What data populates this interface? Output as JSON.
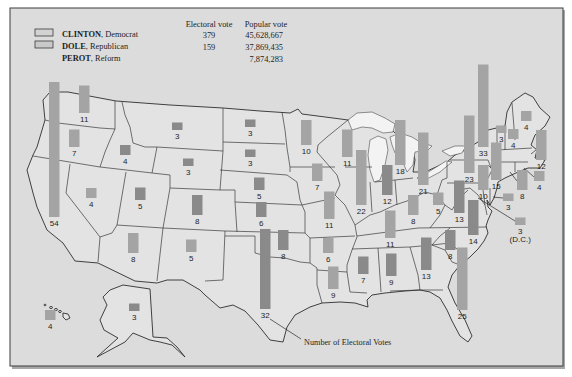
{
  "legend": {
    "headers": {
      "electoral_vote": "Electoral vote",
      "popular_vote": "Popular vote"
    },
    "separator": ", ",
    "candidates": [
      {
        "name": "CLINTON",
        "party": "Democrat",
        "electoral_vote": "379",
        "popular_vote": "45,628,667"
      },
      {
        "name": "DOLE",
        "party": "Republican",
        "electoral_vote": "159",
        "popular_vote": "37,869,435"
      },
      {
        "name": "PEROT",
        "party": "Reform",
        "electoral_vote": "",
        "popular_vote": "7,874,283"
      }
    ]
  },
  "callout": {
    "label": "Number of Electoral Votes"
  },
  "colors": {
    "clinton_bar": "#a4a4a4",
    "dole_bar": "#8a8a8a",
    "clinton_swatch": "#d2d2d2",
    "dole_swatch": "#c9c9c9"
  },
  "map_data": {
    "type": "proportional-bar map",
    "value_meaning": "Number of Electoral Votes",
    "states": [
      {
        "state": "Washington",
        "ev": 11,
        "winner": "Clinton"
      },
      {
        "state": "Oregon",
        "ev": 7,
        "winner": "Clinton"
      },
      {
        "state": "California",
        "ev": 54,
        "winner": "Clinton"
      },
      {
        "state": "Idaho",
        "ev": 4,
        "winner": "Dole"
      },
      {
        "state": "Nevada",
        "ev": 4,
        "winner": "Clinton"
      },
      {
        "state": "Montana",
        "ev": 3,
        "winner": "Dole"
      },
      {
        "state": "Wyoming",
        "ev": 3,
        "winner": "Dole"
      },
      {
        "state": "Utah",
        "ev": 5,
        "winner": "Dole"
      },
      {
        "state": "Colorado",
        "ev": 8,
        "winner": "Dole"
      },
      {
        "state": "Arizona",
        "ev": 8,
        "winner": "Clinton"
      },
      {
        "state": "New Mexico",
        "ev": 5,
        "winner": "Clinton"
      },
      {
        "state": "North Dakota",
        "ev": 3,
        "winner": "Dole"
      },
      {
        "state": "South Dakota",
        "ev": 3,
        "winner": "Dole"
      },
      {
        "state": "Nebraska",
        "ev": 5,
        "winner": "Dole"
      },
      {
        "state": "Kansas",
        "ev": 6,
        "winner": "Dole"
      },
      {
        "state": "Oklahoma",
        "ev": 8,
        "winner": "Dole"
      },
      {
        "state": "Texas",
        "ev": 32,
        "winner": "Dole"
      },
      {
        "state": "Minnesota",
        "ev": 10,
        "winner": "Clinton"
      },
      {
        "state": "Iowa",
        "ev": 7,
        "winner": "Clinton"
      },
      {
        "state": "Missouri",
        "ev": 11,
        "winner": "Clinton"
      },
      {
        "state": "Arkansas",
        "ev": 6,
        "winner": "Clinton"
      },
      {
        "state": "Louisiana",
        "ev": 9,
        "winner": "Clinton"
      },
      {
        "state": "Wisconsin",
        "ev": 11,
        "winner": "Clinton"
      },
      {
        "state": "Illinois",
        "ev": 22,
        "winner": "Clinton"
      },
      {
        "state": "Michigan",
        "ev": 18,
        "winner": "Clinton"
      },
      {
        "state": "Indiana",
        "ev": 12,
        "winner": "Dole"
      },
      {
        "state": "Ohio",
        "ev": 21,
        "winner": "Clinton"
      },
      {
        "state": "Kentucky",
        "ev": 8,
        "winner": "Clinton"
      },
      {
        "state": "Tennessee",
        "ev": 11,
        "winner": "Clinton"
      },
      {
        "state": "Mississippi",
        "ev": 7,
        "winner": "Dole"
      },
      {
        "state": "Alabama",
        "ev": 9,
        "winner": "Dole"
      },
      {
        "state": "Georgia",
        "ev": 13,
        "winner": "Dole"
      },
      {
        "state": "Florida",
        "ev": 25,
        "winner": "Clinton"
      },
      {
        "state": "South Carolina",
        "ev": 8,
        "winner": "Dole"
      },
      {
        "state": "North Carolina",
        "ev": 14,
        "winner": "Dole"
      },
      {
        "state": "Virginia",
        "ev": 13,
        "winner": "Dole"
      },
      {
        "state": "West Virginia",
        "ev": 5,
        "winner": "Clinton"
      },
      {
        "state": "Pennsylvania",
        "ev": 23,
        "winner": "Clinton"
      },
      {
        "state": "New York",
        "ev": 33,
        "winner": "Clinton"
      },
      {
        "state": "New Jersey",
        "ev": 15,
        "winner": "Clinton"
      },
      {
        "state": "Maryland",
        "ev": 10,
        "winner": "Clinton"
      },
      {
        "state": "Delaware",
        "ev": 3,
        "winner": "Clinton"
      },
      {
        "state": "District of Columbia",
        "ev": 3,
        "winner": "Clinton",
        "note": "(D.C.)"
      },
      {
        "state": "Vermont",
        "ev": 3,
        "winner": "Clinton"
      },
      {
        "state": "New Hampshire",
        "ev": 4,
        "winner": "Clinton"
      },
      {
        "state": "Maine",
        "ev": 4,
        "winner": "Clinton"
      },
      {
        "state": "Massachusetts",
        "ev": 12,
        "winner": "Clinton"
      },
      {
        "state": "Rhode Island",
        "ev": 4,
        "winner": "Clinton"
      },
      {
        "state": "Connecticut",
        "ev": 8,
        "winner": "Clinton"
      },
      {
        "state": "Alaska",
        "ev": 3,
        "winner": "Dole"
      },
      {
        "state": "Hawaii",
        "ev": 4,
        "winner": "Clinton"
      }
    ]
  }
}
